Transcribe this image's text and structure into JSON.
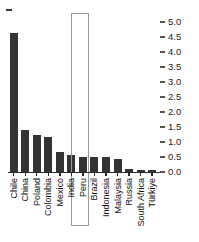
{
  "chart_data": {
    "type": "bar",
    "title": "",
    "xlabel": "",
    "ylabel": "",
    "ylim": [
      0.0,
      5.0
    ],
    "ytick_labels": [
      "5.0",
      "4.5",
      "4.0",
      "3.5",
      "3.0",
      "2.5",
      "2.0",
      "1.5",
      "1.0",
      "0.5",
      "0.0"
    ],
    "ytick_values": [
      5.0,
      4.5,
      4.0,
      3.5,
      3.0,
      2.5,
      2.0,
      1.5,
      1.0,
      0.5,
      0.0
    ],
    "yaxis_position": "right",
    "grid": false,
    "legend": null,
    "categories": [
      "Chile",
      "China",
      "Poland",
      "Colombia",
      "Mexico",
      "India",
      "Peru",
      "Brazil",
      "Indonesia",
      "Malaysia",
      "Russia",
      "South Africa",
      "Türkiye"
    ],
    "values": [
      4.63,
      1.4,
      1.23,
      1.17,
      0.67,
      0.57,
      0.5,
      0.49,
      0.49,
      0.42,
      0.1,
      0.08,
      0.08
    ],
    "bar_color": "#333333",
    "highlight": {
      "category": "India",
      "index": 5,
      "style": "outlined-box",
      "border_color": "#9a9a9a"
    }
  }
}
